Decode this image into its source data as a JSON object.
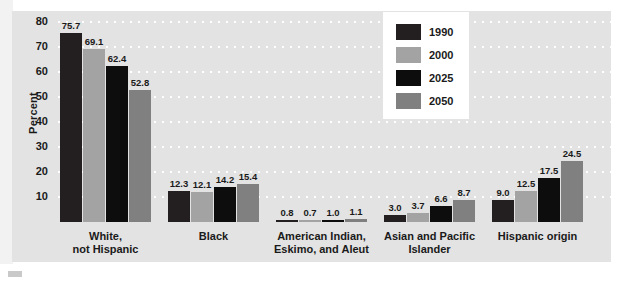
{
  "chart_data": {
    "type": "bar",
    "title": "",
    "xlabel": "",
    "ylabel": "Percent",
    "ylim": [
      0,
      84
    ],
    "yticks": [
      10,
      20,
      30,
      40,
      50,
      60,
      70,
      80
    ],
    "grid": "horizontal-dotted",
    "legend_position": "top-center",
    "categories": [
      "White,\nnot Hispanic",
      "Black",
      "American Indian,\nEskimo, and Aleut",
      "Asian and Pacific\nIslander",
      "Hispanic origin"
    ],
    "category_lines": [
      [
        "White,",
        "not Hispanic"
      ],
      [
        "Black"
      ],
      [
        "American Indian,",
        "Eskimo, and Aleut"
      ],
      [
        "Asian and Pacific",
        "Islander"
      ],
      [
        "Hispanic origin"
      ]
    ],
    "series": [
      {
        "name": "1990",
        "color": "#231f20",
        "values": [
          75.7,
          12.3,
          0.8,
          3.0,
          9.0
        ]
      },
      {
        "name": "2000",
        "color": "#a3a3a3",
        "values": [
          69.1,
          12.1,
          0.7,
          3.7,
          12.5
        ]
      },
      {
        "name": "2025",
        "color": "#0d0d0d",
        "values": [
          62.4,
          14.2,
          1.0,
          6.6,
          17.5
        ]
      },
      {
        "name": "2050",
        "color": "#808080",
        "values": [
          52.8,
          15.4,
          1.1,
          8.7,
          24.5
        ]
      }
    ],
    "value_labels": [
      [
        "75.7",
        "69.1",
        "62.4",
        "52.8"
      ],
      [
        "12.3",
        "12.1",
        "14.2",
        "15.4"
      ],
      [
        "0.8",
        "0.7",
        "1.0",
        "1.1"
      ],
      [
        "3.0",
        "3.7",
        "6.6",
        "8.7"
      ],
      [
        "9.0",
        "12.5",
        "17.5",
        "24.5"
      ]
    ]
  },
  "legend": {
    "entries": [
      {
        "label": "1990"
      },
      {
        "label": "2000"
      },
      {
        "label": "2025"
      },
      {
        "label": "2050"
      }
    ]
  },
  "axis": {
    "y_title": "Percent",
    "y_ticks": [
      "80",
      "70",
      "60",
      "50",
      "40",
      "30",
      "20",
      "10"
    ]
  },
  "colors": {
    "panel_background": "#e3e3e3",
    "figure_background": "#ffffff",
    "gridline": "#ffffff",
    "text": "#1a1a1a",
    "series_1990": "#231f20",
    "series_2000": "#a3a3a3",
    "series_2025": "#0d0d0d",
    "series_2050": "#808080"
  }
}
